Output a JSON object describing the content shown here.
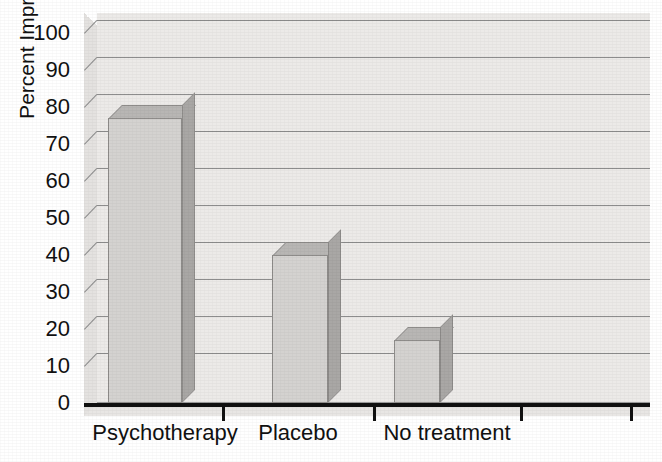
{
  "chart_data": {
    "type": "bar",
    "title": "",
    "subtitle": "",
    "xlabel": "",
    "ylabel": "Percent Improved",
    "categories": [
      "Psychotherapy",
      "Placebo",
      "No treatment"
    ],
    "values": [
      77,
      40,
      17
    ],
    "series": [
      {
        "name": "Percent Improved",
        "values": [
          77,
          40,
          17
        ]
      }
    ],
    "ylim": [
      0,
      100
    ],
    "y_ticks": [
      0,
      10,
      20,
      30,
      40,
      50,
      60,
      70,
      80,
      90,
      100
    ],
    "y_tick_labels": [
      "0",
      "10",
      "20",
      "30",
      "40",
      "50",
      "60",
      "70",
      "80",
      "90",
      "100"
    ],
    "grid": true,
    "grid_axis": "y",
    "legend": false,
    "legend_position": "none",
    "style": "3d-column",
    "annotations": [],
    "colors": {
      "bar_front": "#d4d2d0",
      "bar_side": "#a9a7a5",
      "bar_top": "#b8b6b4",
      "bar_outline": "#8e8c8a",
      "plot_back_wall": "#eceae8",
      "plot_side_wall": "#e4e2e0",
      "gridline": "#8d8d8d",
      "axis": "#111111",
      "text": "#111111",
      "background": "#ffffff"
    }
  },
  "axes": {
    "y_title": "Percent Improved",
    "x_tick_count": 4
  }
}
